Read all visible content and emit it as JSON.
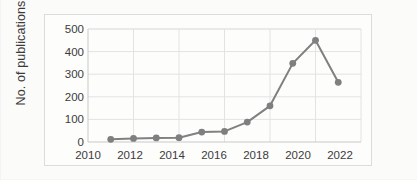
{
  "chart_data": {
    "type": "line",
    "title": "",
    "xlabel": "",
    "ylabel": "No. of publications",
    "x": [
      2011,
      2012,
      2013,
      2014,
      2015,
      2016,
      2017,
      2018,
      2019,
      2020,
      2021
    ],
    "values": [
      12,
      16,
      18,
      19,
      44,
      47,
      88,
      160,
      348,
      450,
      264
    ],
    "series": [
      {
        "name": "No. of publications",
        "values": [
          12,
          16,
          18,
          19,
          44,
          47,
          88,
          160,
          348,
          450,
          264
        ]
      }
    ],
    "xlim": [
      2010,
      2022
    ],
    "ylim": [
      0,
      500
    ],
    "xticks": [
      "2010",
      "2012",
      "2014",
      "2016",
      "2018",
      "2020",
      "2022"
    ],
    "xtick_values": [
      2010,
      2012,
      2014,
      2016,
      2018,
      2020,
      2022
    ],
    "yticks": [
      "0",
      "100",
      "200",
      "300",
      "400",
      "500"
    ],
    "ytick_values": [
      0,
      100,
      200,
      300,
      400,
      500
    ],
    "grid": "horizontal-and-vertical",
    "legend": "none",
    "colors": {
      "line": "#808080",
      "marker": "#7f7f7f",
      "grid": "#e3e3e3",
      "axis": "#c9c9c9",
      "tick_label": "#3b3b3b",
      "background": "#fdfdfc",
      "frame": "#dcdcdc"
    },
    "marker": "circle",
    "line_width": 2
  }
}
